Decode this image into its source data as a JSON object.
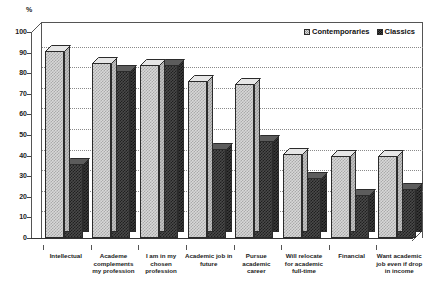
{
  "axis": {
    "unit_label": "%",
    "y_ticks": [
      0,
      10,
      20,
      30,
      40,
      50,
      60,
      70,
      80,
      90,
      100
    ]
  },
  "legend": {
    "items": [
      {
        "label": "Contemporaries",
        "swatch": "light-checker-swatch"
      },
      {
        "label": "Classics",
        "swatch": "dark-checker-swatch"
      }
    ]
  },
  "chart_data": {
    "type": "bar",
    "title": "",
    "subtitle": "",
    "xlabel": "",
    "ylabel": "%",
    "ylim": [
      0,
      100
    ],
    "ytick_step": 10,
    "grid": true,
    "legend_position": "top-right",
    "style": "3d-clustered-bars",
    "categories": [
      "Intellectual",
      "Academe complements my profession",
      "I am in my chosen profession",
      "Academic job in future",
      "Pursue academic career",
      "Will relocate for academic full-time",
      "Financial",
      "Want academic job even if drop in income"
    ],
    "category_lines": [
      [
        "Intellectual"
      ],
      [
        "Academe",
        "complements",
        "my profession"
      ],
      [
        "I am in my",
        "chosen",
        "profession"
      ],
      [
        "Academic job in",
        "future"
      ],
      [
        "Pursue",
        "academic",
        "career"
      ],
      [
        "Will relocate",
        "for academic",
        "full-time"
      ],
      [
        "Financial"
      ],
      [
        "Want academic",
        "job even if drop",
        "in income"
      ]
    ],
    "series": [
      {
        "name": "Contemporaries",
        "values": [
          91,
          85,
          84,
          76,
          75,
          41,
          40,
          40
        ]
      },
      {
        "name": "Classics",
        "values": [
          36,
          81,
          84,
          43,
          47,
          29,
          21,
          24
        ]
      }
    ]
  },
  "colors": {
    "series_contemporaries": "#d8d8d8",
    "series_classics": "#4a4a4a",
    "axis": "#555555",
    "gridline": "#8a8a8a",
    "text": "#1a1a1a",
    "background": "#ffffff"
  }
}
